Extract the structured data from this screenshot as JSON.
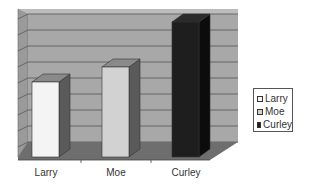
{
  "chart_data": {
    "type": "bar",
    "style": "3d-column",
    "title": "",
    "xlabel": "",
    "ylabel": "",
    "categories": [
      "Larry",
      "Moe",
      "Curley"
    ],
    "values": [
      5,
      6,
      9
    ],
    "ylim": [
      0,
      9
    ],
    "grid": true,
    "gridlines": 9,
    "legend_position": "right",
    "legend": [
      "Larry",
      "Moe",
      "Curley"
    ],
    "colors": {
      "Larry": "#f4f4f4",
      "Moe": "#d2d2d2",
      "Curley": "#1e1e1e",
      "wall": "#a8a8a8",
      "side_wall": "#9a9a9a",
      "floor": "#6e6e6e",
      "gridline": "#555555"
    }
  },
  "legend": {
    "items": [
      {
        "label": "Larry",
        "color": "#f4f4f4"
      },
      {
        "label": "Moe",
        "color": "#d2d2d2"
      },
      {
        "label": "Curley",
        "color": "#1e1e1e"
      }
    ]
  },
  "axis": {
    "categories": [
      "Larry",
      "Moe",
      "Curley"
    ]
  }
}
